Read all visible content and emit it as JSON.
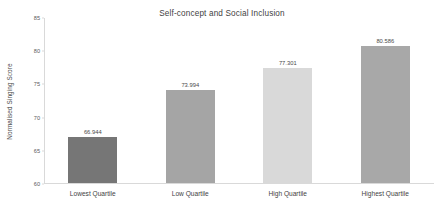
{
  "chart_data": {
    "type": "bar",
    "title": "Self-concept and Social Inclusion",
    "xlabel": "",
    "ylabel": "Normalised Singing Score",
    "categories": [
      "Lowest Quartile",
      "Low Quartile",
      "High Quartile",
      "Highest Quartile"
    ],
    "values": [
      66.944,
      73.994,
      77.301,
      80.586
    ],
    "value_labels": [
      "66.944",
      "73.994",
      "77.301",
      "80.586"
    ],
    "ylim": [
      60,
      85
    ],
    "yticks": [
      85,
      80,
      75,
      70,
      65,
      60
    ],
    "ytick_labels": [
      "85",
      "80",
      "75",
      "70",
      "65",
      "60"
    ],
    "grid": false,
    "legend": false,
    "bar_colors": [
      "#767676",
      "#a5a5a5",
      "#d9d9d9",
      "#a8a8a8"
    ],
    "axis_color": "#d9d9d9",
    "text_color": "#404040",
    "background": "#ffffff"
  }
}
